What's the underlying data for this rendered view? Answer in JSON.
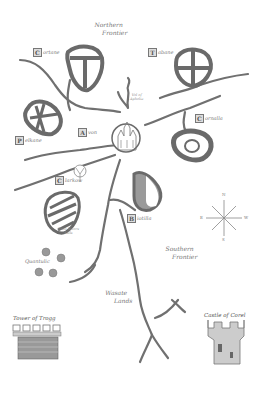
{
  "map": {
    "regions": {
      "northern_frontier": [
        "Northern",
        "Frontier"
      ],
      "southern_frontier": [
        "Southern",
        "Frontier"
      ],
      "wastelands": [
        "Wasate",
        "Lands"
      ]
    },
    "places": {
      "cortane": {
        "initial": "C",
        "rest": "ortane"
      },
      "tabane": {
        "initial": "T",
        "rest": "abane"
      },
      "cornalla": {
        "initial": "C",
        "rest": "ornalla"
      },
      "pelkane": {
        "initial": "P",
        "rest": "elkane"
      },
      "avon": {
        "initial": "A",
        "rest": "von"
      },
      "clarkow": {
        "initial": "C",
        "rest": "larkow"
      },
      "biotilla": {
        "initial": "B",
        "rest": "iotilla"
      }
    },
    "features": {
      "vale_of_aphelia": [
        "Vol of",
        "Aphelia"
      ],
      "twin_rivers_falls": [
        "Twin Rivers",
        "Falls"
      ],
      "quantulic": "Quantulic"
    },
    "landmarks": {
      "tower_of_trogg": "Tower of Trogg",
      "castle_of_corel": "Castle of Corel"
    },
    "compass": {
      "n": "N",
      "s": "S",
      "e": "E",
      "w": "W"
    },
    "colors": {
      "ink": "#6f6f6f",
      "ink_dark": "#555555",
      "paper": "#ffffff",
      "shield_fill": "#9a9a9a"
    }
  }
}
